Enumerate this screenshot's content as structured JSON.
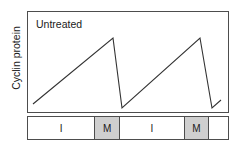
{
  "figure": {
    "name": "cyclin-protein-cell-cycle-graph",
    "axis": {
      "ylabel": "Cyclin protein"
    },
    "annotation": "Untreated",
    "colors": {
      "line": "#333333",
      "frame": "#4d4d4d",
      "shaded_cell": "#cfcfcf",
      "plain_cell": "#ffffff",
      "text": "#1a1a1a",
      "background": "#ffffff"
    },
    "phase_bar": [
      {
        "label": "I",
        "shaded": false,
        "width_pct": 33.7
      },
      {
        "label": "M",
        "shaded": true,
        "width_pct": 12.4
      },
      {
        "label": "I",
        "shaded": false,
        "width_pct": 32.2
      },
      {
        "label": "M",
        "shaded": true,
        "width_pct": 12.4
      },
      {
        "label": "",
        "shaded": false,
        "width_pct": 9.3
      }
    ]
  },
  "chart_data": {
    "type": "line",
    "title": "Untreated",
    "xlabel": "",
    "ylabel": "Cyclin protein",
    "grid": false,
    "legend": null,
    "xlim": [
      0,
      100
    ],
    "ylim": [
      0,
      100
    ],
    "axis_ticks": {
      "x": [],
      "y": []
    },
    "series": [
      {
        "name": "Cyclin protein level",
        "x": [
          3,
          42.6,
          47.0,
          85.6,
          91.6,
          96.0
        ],
        "y": [
          8.8,
          73.5,
          4.9,
          73.5,
          4.9,
          12.7
        ],
        "points_px": [
          {
            "x": 33,
            "y": 104
          },
          {
            "x": 113,
            "y": 38
          },
          {
            "x": 122,
            "y": 108
          },
          {
            "x": 200,
            "y": 38
          },
          {
            "x": 212,
            "y": 108
          },
          {
            "x": 221,
            "y": 100
          }
        ]
      }
    ],
    "annotations": [
      {
        "text": "Untreated",
        "x_px": 35,
        "y_px": 17
      }
    ],
    "phase_categories": [
      "I",
      "M",
      "I",
      "M",
      ""
    ]
  }
}
